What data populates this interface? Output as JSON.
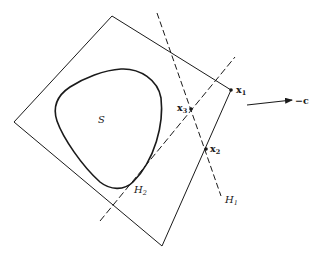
{
  "diagram": {
    "type": "geometric-figure",
    "colors": {
      "stroke": "#1a1a1a",
      "background": "#ffffff"
    },
    "polygon": {
      "name": "feasible polyhedron",
      "vertices": [
        [
          112,
          16
        ],
        [
          231,
          90
        ],
        [
          162,
          246
        ],
        [
          14,
          122
        ]
      ]
    },
    "set_region": {
      "label": "S"
    },
    "points": [
      {
        "id": "x1",
        "label": "x",
        "subscript": "1",
        "x": 231,
        "y": 90
      },
      {
        "id": "x2",
        "label": "x",
        "subscript": "2",
        "x": 206,
        "y": 149
      },
      {
        "id": "x3",
        "label": "x",
        "subscript": "3",
        "x": 191,
        "y": 109
      }
    ],
    "hyperplanes": [
      {
        "id": "H1",
        "label": "H",
        "subscript": "1",
        "style": "dashed",
        "from": [
          157,
          13
        ],
        "to": [
          221,
          196
        ]
      },
      {
        "id": "H2",
        "label": "H",
        "subscript": "2",
        "style": "dashed",
        "from": [
          100,
          221
        ],
        "to": [
          235,
          57
        ]
      }
    ],
    "direction_arrow": {
      "label": "−c",
      "from": [
        247,
        105
      ],
      "to": [
        293,
        100
      ]
    }
  }
}
